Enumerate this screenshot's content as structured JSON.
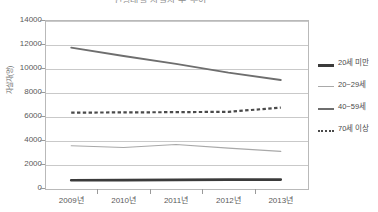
{
  "chart_data": {
    "type": "line",
    "title": "연령대별 자살자 수 추이",
    "xlabel": "",
    "ylabel": "자살자(명)",
    "categories": [
      "2009년",
      "2010년",
      "2011년",
      "2012년",
      "2013년"
    ],
    "ylim": [
      0,
      14000
    ],
    "y_ticks": [
      0,
      2000,
      4000,
      6000,
      8000,
      10000,
      12000,
      14000
    ],
    "y_tick_labels": [
      "0",
      "2000",
      "4000",
      "6000",
      "8000",
      "10000",
      "12000",
      "14000"
    ],
    "grid": true,
    "legend_position": "right",
    "series": [
      {
        "name": "20세 미만",
        "color": "#3b3b3b",
        "style": "solid",
        "width": 2.6,
        "values": [
          640,
          660,
          680,
          700,
          700
        ]
      },
      {
        "name": "20~29세",
        "color": "#a9a9a9",
        "style": "solid",
        "width": 1.1,
        "values": [
          3520,
          3380,
          3620,
          3320,
          3050
        ]
      },
      {
        "name": "40~59세",
        "color": "#6e6e6e",
        "style": "solid",
        "width": 1.8,
        "values": [
          11700,
          11000,
          10350,
          9620,
          9000
        ]
      },
      {
        "name": "70세 이상",
        "color": "#4a4a4a",
        "style": "dotted",
        "width": 2.2,
        "values": [
          6280,
          6300,
          6320,
          6350,
          6700
        ]
      }
    ]
  },
  "axis": {
    "y_title": "자살자(명)",
    "y_labels": [
      "14000",
      "12000",
      "10000",
      "8000",
      "6000",
      "4000",
      "2000",
      "0"
    ],
    "x_labels": [
      "2009년",
      "2010년",
      "2011년",
      "2012년",
      "2013년"
    ]
  },
  "legend": {
    "items": [
      {
        "label": "20세 미만"
      },
      {
        "label": "20~29세"
      },
      {
        "label": "40~59세"
      },
      {
        "label": "70세 이상"
      }
    ]
  },
  "colors": {
    "frame": "#b9b9b9",
    "grid": "#c9c9c9",
    "text": "#555555",
    "series_under20": "#3b3b3b",
    "series_20s": "#a9a9a9",
    "series_40to59": "#6e6e6e",
    "series_70plus": "#4a4a4a"
  }
}
